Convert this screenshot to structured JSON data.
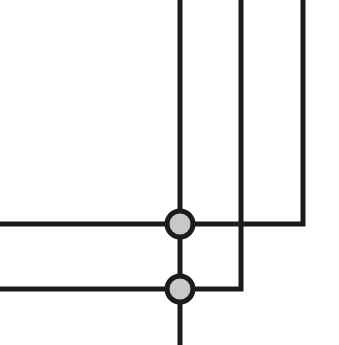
{
  "diagram": {
    "width": 339,
    "height": 345,
    "background": "#ffffff",
    "line_color": "#1c1c1c",
    "line_width": 5,
    "node_fill": "#c8c8c8",
    "node_stroke": "#1c1c1c",
    "node_stroke_width": 5,
    "node_radius": 13,
    "wires": [
      {
        "id": "vertical-main",
        "points": [
          [
            180,
            0
          ],
          [
            180,
            345
          ]
        ]
      },
      {
        "id": "wire-upper",
        "points": [
          [
            0,
            224
          ],
          [
            303,
            224
          ],
          [
            303,
            0
          ]
        ]
      },
      {
        "id": "wire-lower",
        "points": [
          [
            0,
            289
          ],
          [
            241,
            289
          ],
          [
            241,
            0
          ]
        ]
      }
    ],
    "junctions": [
      {
        "id": "junction-upper",
        "cx": 180,
        "cy": 224
      },
      {
        "id": "junction-lower",
        "cx": 180,
        "cy": 289
      }
    ]
  }
}
